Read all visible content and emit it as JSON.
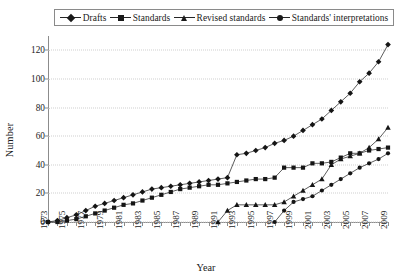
{
  "legend": {
    "items": [
      {
        "label": "Drafts",
        "marker": "diamond-marker-icon"
      },
      {
        "label": "Standards",
        "marker": "square-marker-icon"
      },
      {
        "label": "Revised standards",
        "marker": "triangle-marker-icon"
      },
      {
        "label": "Standards' interpretations",
        "marker": "circle-marker-icon"
      }
    ]
  },
  "chart_data": {
    "type": "line",
    "title": "",
    "xlabel": "Year",
    "ylabel": "Number",
    "xlim": [
      1973,
      2009
    ],
    "ylim": [
      0,
      130
    ],
    "yticks": [
      0,
      20,
      40,
      60,
      80,
      100,
      120
    ],
    "xticks": [
      1973,
      1975,
      1977,
      1979,
      1981,
      1983,
      1985,
      1987,
      1989,
      1991,
      1993,
      1995,
      1997,
      1999,
      2001,
      2003,
      2005,
      2007,
      2009
    ],
    "grid": "horizontal-dotted",
    "legend_position": "top",
    "x": [
      1973,
      1974,
      1975,
      1976,
      1977,
      1978,
      1979,
      1980,
      1981,
      1982,
      1983,
      1984,
      1985,
      1986,
      1987,
      1988,
      1989,
      1990,
      1991,
      1992,
      1993,
      1994,
      1995,
      1996,
      1997,
      1998,
      1999,
      2000,
      2001,
      2002,
      2003,
      2004,
      2005,
      2006,
      2007,
      2008,
      2009
    ],
    "series": [
      {
        "name": "Drafts",
        "marker": "diamond",
        "values": [
          0,
          1,
          3,
          5,
          8,
          11,
          13,
          15,
          17,
          19,
          21,
          23,
          24,
          25,
          26,
          27,
          28,
          29,
          30,
          31,
          32,
          33,
          34,
          35,
          36,
          38,
          40,
          42,
          46,
          48,
          49,
          50,
          50,
          50,
          51,
          52,
          52
        ]
      },
      {
        "name": "Standards",
        "marker": "square",
        "values": [
          0,
          0,
          1,
          2,
          4,
          6,
          8,
          10,
          12,
          13,
          15,
          17,
          19,
          21,
          23,
          24,
          25,
          26,
          26,
          27,
          28,
          29,
          30,
          30,
          31,
          31,
          31,
          31,
          31,
          31,
          31,
          31,
          31,
          31,
          31,
          31,
          31
        ]
      },
      {
        "name": "Revised standards",
        "marker": "triangle",
        "values": [
          null,
          null,
          null,
          null,
          null,
          null,
          null,
          null,
          null,
          null,
          null,
          null,
          null,
          null,
          null,
          null,
          null,
          null,
          0,
          8,
          12,
          12,
          12,
          12,
          12,
          14,
          18,
          22,
          26,
          30,
          40,
          44,
          46,
          48,
          52,
          58,
          66
        ]
      },
      {
        "name": "Standards' interpretations",
        "marker": "circle",
        "values": [
          null,
          null,
          null,
          null,
          null,
          null,
          null,
          null,
          null,
          null,
          null,
          null,
          null,
          null,
          null,
          null,
          null,
          null,
          null,
          null,
          null,
          null,
          null,
          null,
          0,
          8,
          14,
          16,
          18,
          22,
          26,
          30,
          34,
          38,
          41,
          44,
          48
        ]
      }
    ],
    "series_overlay_note": "Drafts curve continues upward steeply after 1995",
    "drafts_values_actual": [
      0,
      1,
      3,
      5,
      8,
      11,
      13,
      15,
      17,
      19,
      21,
      23,
      24,
      25,
      26,
      27,
      28,
      29,
      30,
      31,
      47,
      48,
      50,
      52,
      55,
      57,
      60,
      64,
      68,
      72,
      78,
      84,
      90,
      98,
      104,
      112,
      124
    ],
    "standards_values_actual": [
      0,
      0,
      1,
      2,
      4,
      6,
      8,
      10,
      12,
      13,
      15,
      17,
      19,
      21,
      23,
      24,
      25,
      26,
      26,
      27,
      28,
      29,
      30,
      30,
      31,
      38,
      38,
      38,
      41,
      41,
      42,
      45,
      48,
      48,
      50,
      51,
      52
    ]
  }
}
